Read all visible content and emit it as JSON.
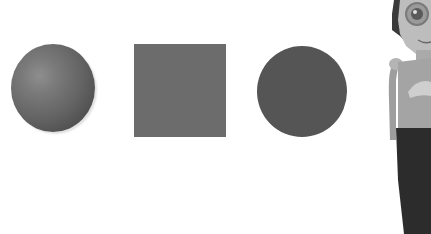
{
  "scene": {
    "background_color": "#ffffff",
    "shapes": [
      {
        "name": "sphere",
        "type": "3d-sphere",
        "color": "#6a6a6a"
      },
      {
        "name": "square",
        "type": "square",
        "color": "#6c6c6c"
      },
      {
        "name": "circle",
        "type": "circle",
        "color": "#555555"
      }
    ],
    "character": {
      "description": "cartoon girl with glasses, tank top and dark pants",
      "cropped": true
    }
  }
}
